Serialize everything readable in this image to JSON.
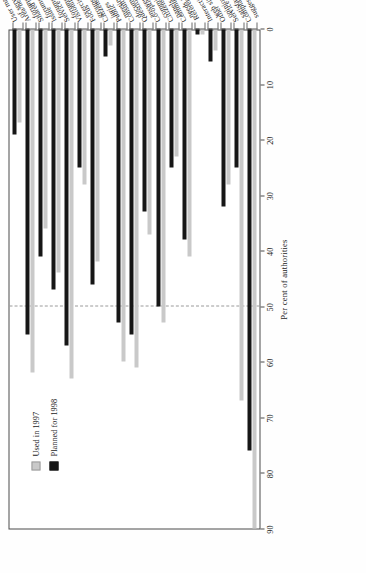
{
  "chart_data": {
    "type": "bar",
    "orientation": "horizontal",
    "title": "",
    "xlabel": "Per cent of authorities",
    "ylabel": "",
    "xlim": [
      0,
      90
    ],
    "xticks": [
      0,
      10,
      20,
      30,
      40,
      50,
      60,
      70,
      80,
      90
    ],
    "grid": false,
    "reference_line": 50,
    "legend_position": "top-left",
    "categories": [
      "User management\nof services",
      "Area/neighbourhood\nforums",
      "Shared interest\nforums",
      "Issue\nforums",
      "Service user\nforums",
      "Visioning\nexercises",
      "Focus\ngroups",
      "Citizens'\njuries",
      "Public\nmeetings",
      "Consultation\ndocuments",
      "Question and\nanswer sessions",
      "Co-option/\ncommittee work",
      "Citizens'\npanels",
      "Community plan/\nneeds analysis",
      "Referenda",
      "Interactive\nweb site",
      "Other\nopinion polls",
      "Service\nsatisfaction surveys",
      "Complaints/\nsuggestion schemes"
    ],
    "series": [
      {
        "name": "Used in 1997",
        "color": "#c9c9c9",
        "values": [
          17,
          62,
          36,
          44,
          63,
          28,
          42,
          3,
          60,
          61,
          37,
          53,
          23,
          41,
          1,
          4,
          28,
          67,
          90
        ]
      },
      {
        "name": "Planned for 1998",
        "color": "#161616",
        "values": [
          19,
          55,
          41,
          47,
          57,
          25,
          46,
          5,
          53,
          55,
          33,
          50,
          25,
          38,
          1,
          6,
          32,
          25,
          76
        ]
      }
    ]
  },
  "legend": {
    "items": [
      {
        "label": "Used in 1997",
        "swatch": "light-gray-swatch"
      },
      {
        "label": "Planned for 1998",
        "swatch": "black-swatch"
      }
    ]
  },
  "axis": {
    "title": "Per cent of authorities",
    "ticks": [
      "0",
      "10",
      "20",
      "30",
      "40",
      "50",
      "60",
      "70",
      "80",
      "90"
    ]
  }
}
